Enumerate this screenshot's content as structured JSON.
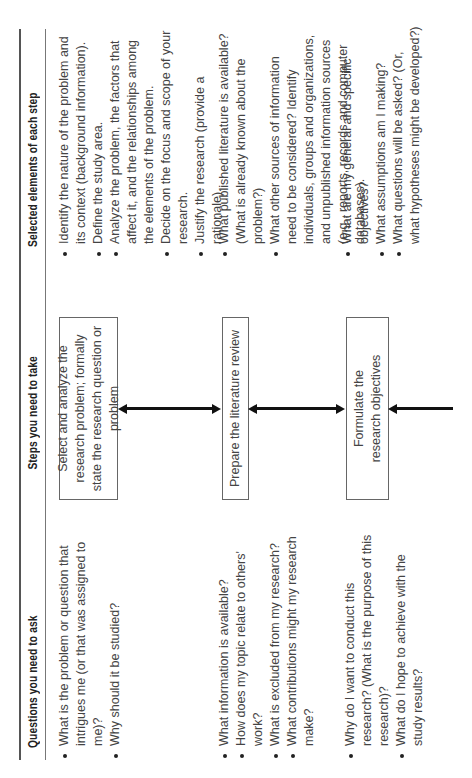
{
  "table": {
    "headers": {
      "questions": "Questions you need to ask",
      "steps": "Steps you need to take",
      "elements": "Selected elements of each step"
    },
    "rows": [
      {
        "questions": [
          "What is the problem or question that intrigues me (or that was assigned to me)?",
          "Why should it be studied?"
        ],
        "step": "Select and analyze the research problem; formally state the research question or problem",
        "elements": [
          "Identify the nature of the problem and its context (background information).",
          "Define the study area.",
          "Analyze the problem, the factors that affect it, and the relationships among the elements of the problem.",
          "Decide on the focus and scope of your research.",
          "Justify the research (provide a rationale)."
        ]
      },
      {
        "questions": [
          "What information is available?",
          "How does my topic relate to others' work?",
          "What is excluded from my research?",
          "What contributions might my research make?"
        ],
        "step": "Prepare the literature review",
        "elements": [
          "What published literature is available? (What is already known about the problem?)",
          "What other sources of information need to be considered? Identify individuals, groups and organizations, and unpublished information sources (e.g., reports, records and computer databases)."
        ]
      },
      {
        "questions": [
          "Why do I want to conduct this research? (What is the purpose of this research)?",
          "What do I hope to achieve with the study results?"
        ],
        "step": "Formulate the research objectives",
        "elements": [
          "What are my general and specific objectives?",
          "What assumptions am I making?",
          "What questions will be asked? (Or, what hypotheses might be developed?)"
        ]
      }
    ],
    "arrows": [
      {
        "from": "row1",
        "to": "row2",
        "type": "double-headed"
      },
      {
        "from": "row2",
        "to": "row3",
        "type": "double-headed"
      },
      {
        "from": "next-step",
        "to": "row3",
        "type": "single-headed"
      }
    ]
  },
  "colors": {
    "text": "#444444",
    "rule": "#555555",
    "arrow": "#111111",
    "box_border": "#666666"
  }
}
